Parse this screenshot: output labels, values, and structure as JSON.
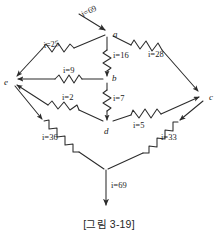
{
  "figure": {
    "caption": "[그림 3-19]",
    "ink_color": "#2b2b2b",
    "background_color": "#ffffff"
  },
  "nodes": [
    {
      "id": "a",
      "label": "a",
      "x": 110,
      "y": 33
    },
    {
      "id": "b",
      "label": "b",
      "x": 110,
      "y": 79
    },
    {
      "id": "c",
      "label": "c",
      "x": 206,
      "y": 97
    },
    {
      "id": "d",
      "label": "d",
      "x": 110,
      "y": 125
    },
    {
      "id": "e",
      "label": "e",
      "x": 10,
      "y": 82
    }
  ],
  "branches": [
    {
      "id": "source-in",
      "label": "i=69",
      "value": 69,
      "from": "source",
      "to": "a",
      "has_resistor": false
    },
    {
      "id": "a-e",
      "label": "i=25",
      "value": 25,
      "from": "a",
      "to": "e",
      "has_resistor": true
    },
    {
      "id": "a-b",
      "label": "i=16",
      "value": 16,
      "from": "a",
      "to": "b",
      "has_resistor": true
    },
    {
      "id": "a-c",
      "label": "i=28",
      "value": 28,
      "from": "a",
      "to": "c",
      "has_resistor": true
    },
    {
      "id": "b-e",
      "label": "i=9",
      "value": 9,
      "from": "b",
      "to": "e",
      "has_resistor": true
    },
    {
      "id": "b-d",
      "label": "i=7",
      "value": 7,
      "from": "b",
      "to": "d",
      "has_resistor": true
    },
    {
      "id": "d-e",
      "label": "i=2",
      "value": 2,
      "from": "d",
      "to": "e",
      "has_resistor": true
    },
    {
      "id": "d-c",
      "label": "i=5",
      "value": 5,
      "from": "d",
      "to": "c",
      "has_resistor": true
    },
    {
      "id": "e-out",
      "label": "i=36",
      "value": 36,
      "from": "e",
      "to": "junction",
      "has_resistor": true
    },
    {
      "id": "c-out",
      "label": "i=33",
      "value": 33,
      "from": "c",
      "to": "junction",
      "has_resistor": true
    },
    {
      "id": "source-out",
      "label": "i=69",
      "value": 69,
      "from": "junction",
      "to": "ground",
      "has_resistor": false
    }
  ],
  "labels": {
    "i69_top": {
      "text_prefix": "i",
      "text_eq": "=",
      "text_value": "69"
    },
    "i25": {
      "text_prefix": "i",
      "text_eq": "=",
      "text_value": "25"
    },
    "i16": {
      "text_prefix": "i",
      "text_eq": "=",
      "text_value": "16"
    },
    "i28": {
      "text_prefix": "i",
      "text_eq": "=",
      "text_value": "28"
    },
    "i9": {
      "text_prefix": "i",
      "text_eq": "=",
      "text_value": "9"
    },
    "i7": {
      "text_prefix": "i",
      "text_eq": "=",
      "text_value": "7"
    },
    "i2": {
      "text_prefix": "i",
      "text_eq": "=",
      "text_value": "2"
    },
    "i5": {
      "text_prefix": "i",
      "text_eq": "=",
      "text_value": "5"
    },
    "i36": {
      "text_prefix": "i",
      "text_eq": "=",
      "text_value": "36"
    },
    "i33": {
      "text_prefix": "i",
      "text_eq": "=",
      "text_value": "33"
    },
    "i69_bot": {
      "text_prefix": "i",
      "text_eq": "=",
      "text_value": "69"
    }
  }
}
